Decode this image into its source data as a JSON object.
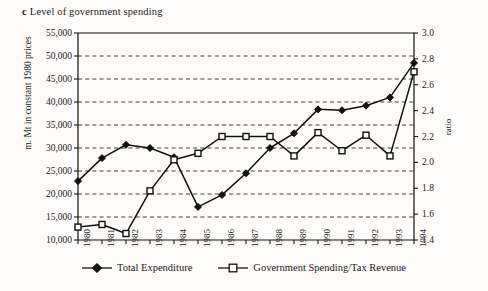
{
  "title": {
    "letter": "c",
    "text": "Level of government spending"
  },
  "axes": {
    "left_label": "m. Mt in constant 1980 prices",
    "right_label": "ratio"
  },
  "legend": [
    {
      "label": "Total Expenditure",
      "marker": "filled-diamond"
    },
    {
      "label": "Government Spending/Tax Revenue",
      "marker": "open-square"
    }
  ],
  "chart_data": {
    "type": "line",
    "xlabel": "",
    "ylabel": "m. Mt in constant 1980 prices",
    "y2label": "ratio",
    "grid": true,
    "legend_position": "bottom",
    "categories": [
      "1980",
      "1981",
      "1982",
      "1983",
      "1984",
      "1985",
      "1986",
      "1987",
      "1988",
      "1989",
      "1990",
      "1991",
      "1992",
      "1993",
      "1994"
    ],
    "ylim": [
      10000,
      55000
    ],
    "yticks": [
      "10,000",
      "15,000",
      "20,000",
      "25,000",
      "30,000",
      "35,000",
      "40,000",
      "45,000",
      "50,000",
      "55,000"
    ],
    "ytick_values": [
      10000,
      15000,
      20000,
      25000,
      30000,
      35000,
      40000,
      45000,
      50000,
      55000
    ],
    "y2lim": [
      1.4,
      3.0
    ],
    "y2ticks": [
      "1.4",
      "1.6",
      "1.8",
      "2.0",
      "2.2",
      "2.4",
      "2.6",
      "2.8",
      "3.0"
    ],
    "y2tick_values": [
      1.4,
      1.6,
      1.8,
      2.0,
      2.2,
      2.4,
      2.6,
      2.8,
      3.0
    ],
    "series": [
      {
        "name": "Total Expenditure",
        "axis": "left",
        "marker": "filled-diamond",
        "units": "m. Mt in constant 1980 prices",
        "values": [
          22800,
          27800,
          30700,
          30000,
          28000,
          17200,
          19800,
          24500,
          30000,
          33200,
          38400,
          38200,
          39200,
          41000,
          48500
        ]
      },
      {
        "name": "Government Spending/Tax Revenue",
        "axis": "right",
        "marker": "open-square",
        "units": "ratio",
        "values": [
          1.5,
          1.52,
          1.45,
          1.78,
          2.02,
          2.07,
          2.2,
          2.2,
          2.2,
          2.05,
          2.23,
          2.09,
          2.21,
          2.05,
          2.7
        ]
      }
    ]
  }
}
